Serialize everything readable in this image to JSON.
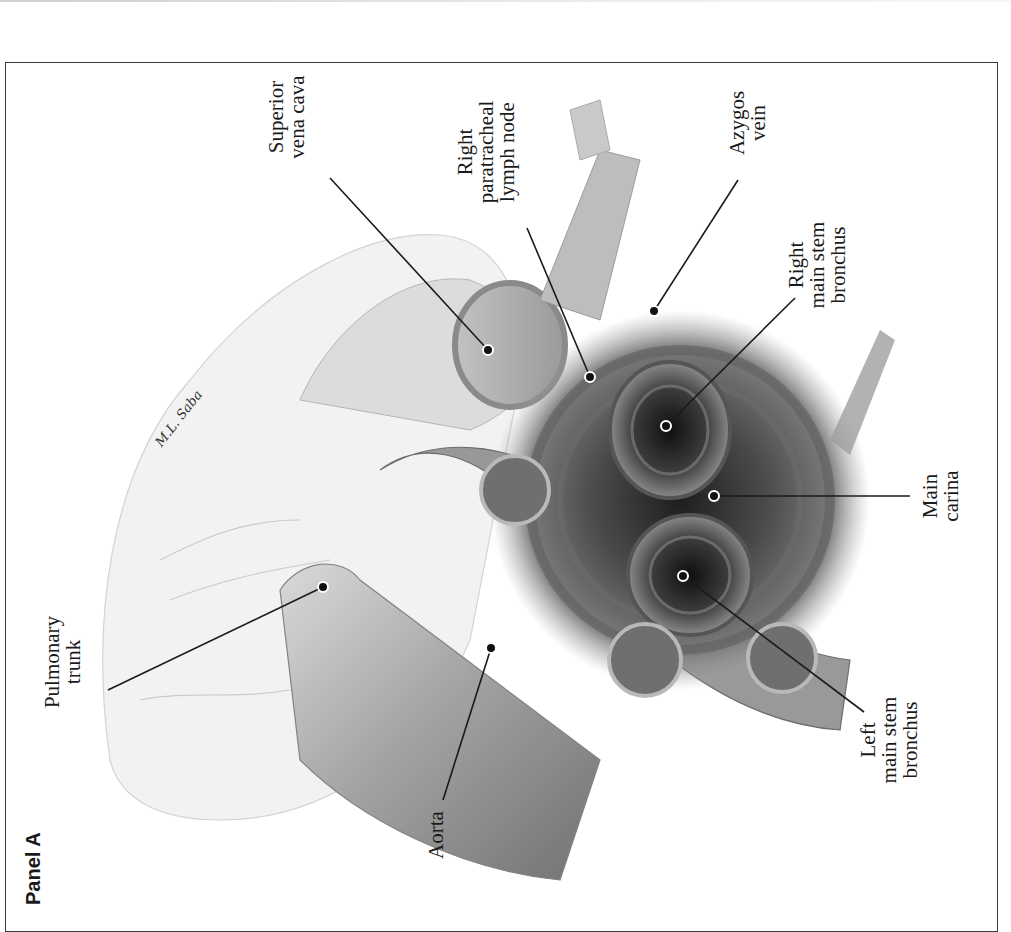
{
  "figure": {
    "panel_label": "Panel A",
    "orientation": "rotated 90° counterclockwise",
    "signature": "M.L. Saba",
    "palette": {
      "frame": "#3a3a3a",
      "leader_line": "#1a1a1a",
      "marker_fill": "#111111",
      "marker_halo": "#ffffff",
      "vessel_light": "#cfcfcf",
      "vessel_mid": "#9a9a9a",
      "airway_dark": "#2a2a2a"
    }
  },
  "labels": [
    {
      "id": "pulmonary-trunk",
      "lines": [
        "Pulmonary",
        "trunk"
      ]
    },
    {
      "id": "superior-vena-cava",
      "lines": [
        "Superior",
        "vena cava"
      ]
    },
    {
      "id": "right-paratracheal-lymph-node",
      "lines": [
        "Right",
        "paratracheal",
        "lymph node"
      ]
    },
    {
      "id": "azygos-vein",
      "lines": [
        "Azygos",
        "vein"
      ]
    },
    {
      "id": "right-main-stem-bronchus",
      "lines": [
        "Right",
        "main stem",
        "bronchus"
      ]
    },
    {
      "id": "main-carina",
      "lines": [
        "Main",
        "carina"
      ]
    },
    {
      "id": "left-main-stem-bronchus",
      "lines": [
        "Left",
        "main stem",
        "bronchus"
      ]
    },
    {
      "id": "aorta",
      "lines": [
        "Aorta"
      ]
    }
  ]
}
